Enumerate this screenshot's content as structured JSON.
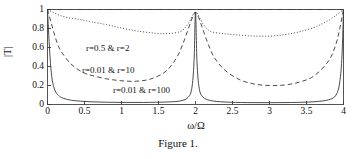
{
  "figure": {
    "caption": "Figure 1.",
    "background_color": "#ffffff",
    "axis_color": "#3a3a3a",
    "curve_color": "#2b2b2b"
  },
  "chart_data": {
    "type": "line",
    "title": "",
    "subtitle": "",
    "xlabel": "ω/Ω",
    "ylabel": "|T|",
    "xlim": [
      0,
      4
    ],
    "ylim": [
      0,
      1
    ],
    "grid": false,
    "legend_position": "inline-annotations",
    "xticks": [
      "0",
      "0.5",
      "1",
      "1.5",
      "2",
      "2.5",
      "3",
      "3.5",
      "4"
    ],
    "xtick_values": [
      0,
      0.5,
      1,
      1.5,
      2,
      2.5,
      3,
      3.5,
      4
    ],
    "yticks": [
      "0",
      "0.2",
      "0.4",
      "0.6",
      "0.8",
      "1"
    ],
    "ytick_values": [
      0,
      0.2,
      0.4,
      0.6,
      0.8,
      1
    ],
    "annotations": [
      {
        "text": "r=0.5 & r=2",
        "x": 1.05,
        "y": 0.66,
        "style": "dotted"
      },
      {
        "text": "r=0.01 & r=10",
        "x": 0.95,
        "y": 0.42,
        "style": "dashed"
      },
      {
        "text": "r=0.01 & r=100",
        "x": 1.6,
        "y": 0.17,
        "style": "solid"
      }
    ],
    "series": [
      {
        "name": "r=1",
        "label": "r=1",
        "style": "dashdot",
        "x": [
          0,
          0.5,
          1,
          1.5,
          2,
          2.5,
          3,
          3.5,
          4
        ],
        "values": [
          1,
          1,
          1,
          1,
          1,
          1,
          1,
          1,
          1
        ]
      },
      {
        "name": "r=0.5 & r=2",
        "label": "r=0.5 & r=2",
        "style": "dotted",
        "x": [
          0,
          0.1,
          0.2,
          0.3,
          0.4,
          0.5,
          0.6,
          0.8,
          1.0,
          1.2,
          1.4,
          1.6,
          1.8,
          1.9,
          2.0,
          2.1,
          2.2,
          2.4,
          2.6,
          2.8,
          3.0,
          3.2,
          3.4,
          3.6,
          3.7,
          3.8,
          3.9,
          4.0
        ],
        "values": [
          1.0,
          0.96,
          0.93,
          0.91,
          0.9,
          0.885,
          0.87,
          0.84,
          0.805,
          0.775,
          0.755,
          0.745,
          0.77,
          0.85,
          0.97,
          0.85,
          0.77,
          0.745,
          0.73,
          0.72,
          0.72,
          0.735,
          0.765,
          0.81,
          0.845,
          0.885,
          0.94,
          1.0
        ]
      },
      {
        "name": "r=0.01 & r=10",
        "label": "r=0.01 & r=10",
        "style": "dashed",
        "x": [
          0,
          0.05,
          0.1,
          0.15,
          0.2,
          0.3,
          0.4,
          0.5,
          0.6,
          0.8,
          1.0,
          1.2,
          1.4,
          1.6,
          1.75,
          1.85,
          1.95,
          2.0,
          2.05,
          2.15,
          2.25,
          2.4,
          2.6,
          2.8,
          3.0,
          3.2,
          3.4,
          3.6,
          3.8,
          3.9,
          3.95,
          4.0
        ],
        "values": [
          1.0,
          0.86,
          0.72,
          0.61,
          0.54,
          0.44,
          0.375,
          0.33,
          0.305,
          0.27,
          0.25,
          0.245,
          0.27,
          0.35,
          0.5,
          0.68,
          0.9,
          0.97,
          0.9,
          0.68,
          0.5,
          0.36,
          0.26,
          0.215,
          0.2,
          0.205,
          0.235,
          0.3,
          0.46,
          0.64,
          0.8,
          1.0
        ]
      },
      {
        "name": "r=0.01 & r=100",
        "label": "r=0.01 & r=100",
        "style": "solid",
        "x": [
          0,
          0.03,
          0.06,
          0.1,
          0.15,
          0.2,
          0.3,
          0.4,
          0.6,
          0.8,
          1.0,
          1.3,
          1.6,
          1.8,
          1.9,
          1.95,
          1.98,
          2.0,
          2.02,
          2.05,
          2.1,
          2.2,
          2.4,
          2.7,
          3.0,
          3.3,
          3.6,
          3.8,
          3.9,
          3.95,
          3.98,
          4.0
        ],
        "values": [
          1.0,
          0.55,
          0.28,
          0.15,
          0.095,
          0.07,
          0.048,
          0.038,
          0.028,
          0.024,
          0.022,
          0.022,
          0.026,
          0.038,
          0.075,
          0.17,
          0.45,
          0.97,
          0.45,
          0.17,
          0.08,
          0.042,
          0.026,
          0.02,
          0.019,
          0.021,
          0.029,
          0.05,
          0.1,
          0.24,
          0.52,
          1.0
        ]
      }
    ]
  }
}
